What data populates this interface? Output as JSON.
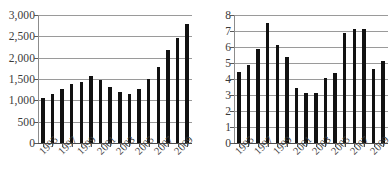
{
  "figure": {
    "background_color": "#ffffff",
    "bar_color": "#111111",
    "grid_color": "#9a9a9a",
    "axis_color": "#4a4a4a",
    "text_color": "#3a3a3a",
    "panel_count": 2
  },
  "chart_data": [
    {
      "type": "bar",
      "title": "",
      "xlabel": "",
      "ylabel": "",
      "grid": true,
      "legend": false,
      "ylim": [
        0,
        3000
      ],
      "yticks": [
        0,
        500,
        1000,
        1500,
        2000,
        2500,
        3000
      ],
      "ytick_labels": [
        "0",
        "500",
        "1,000",
        "1,500",
        "2,000",
        "2,500",
        "3,000"
      ],
      "categories": [
        "1995",
        "1996",
        "1997",
        "1998",
        "1999",
        "2000",
        "2001",
        "2002",
        "2003",
        "2004",
        "2005",
        "2006",
        "2007",
        "2008",
        "2009",
        "2010"
      ],
      "xtick_labels_shown": [
        "1995",
        "1997",
        "1999",
        "2001",
        "2003",
        "2005",
        "2007",
        "2009"
      ],
      "values": [
        1050,
        1140,
        1260,
        1390,
        1440,
        1560,
        1480,
        1320,
        1200,
        1150,
        1270,
        1500,
        1790,
        2170,
        2450,
        2800
      ]
    },
    {
      "type": "bar",
      "title": "",
      "xlabel": "",
      "ylabel": "",
      "grid": true,
      "legend": false,
      "ylim": [
        0,
        8
      ],
      "yticks": [
        0,
        1,
        2,
        3,
        4,
        5,
        6,
        7,
        8
      ],
      "ytick_labels": [
        "0",
        "1",
        "2",
        "3",
        "4",
        "5",
        "6",
        "7",
        "8"
      ],
      "categories": [
        "1995",
        "1996",
        "1997",
        "1998",
        "1999",
        "2000",
        "2001",
        "2002",
        "2003",
        "2004",
        "2005",
        "2006",
        "2007",
        "2008",
        "2009",
        "2010"
      ],
      "xtick_labels_shown": [
        "1995",
        "1997",
        "1999",
        "2001",
        "2003",
        "2005",
        "2007",
        "2009"
      ],
      "values": [
        4.45,
        4.85,
        5.9,
        7.5,
        6.1,
        5.35,
        3.45,
        3.15,
        3.15,
        4.05,
        4.4,
        6.85,
        7.1,
        7.15,
        4.65,
        5.15
      ]
    }
  ]
}
